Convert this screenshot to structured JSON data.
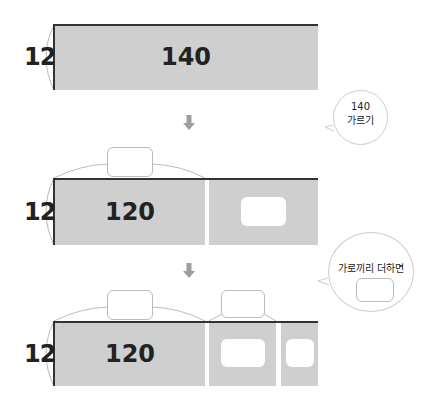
{
  "diagram": {
    "step1": {
      "height": "12",
      "width": "140"
    },
    "step2": {
      "height": "12",
      "width": "120",
      "blank_part": ""
    },
    "step3": {
      "height": "12",
      "width": "120",
      "blank_mid": "",
      "blank_small": ""
    },
    "bubble1": {
      "line1": "140",
      "line2": "가르기"
    },
    "bubble2": {
      "text": "가로끼리 더하면",
      "answer": ""
    }
  },
  "colors": {
    "block": "#cfcfcf",
    "edge": "#333333",
    "arrow": "#9e9e9e"
  }
}
